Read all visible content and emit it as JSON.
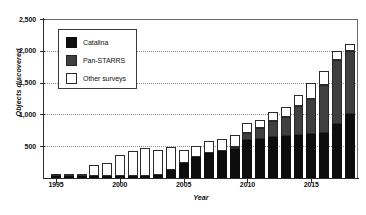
{
  "chart_data": {
    "type": "bar",
    "stacked": true,
    "title": "",
    "xlabel": "Year",
    "ylabel": "Objects discovered",
    "ylim": [
      0,
      2500
    ],
    "ytick_labels": [
      "500",
      "1,000",
      "1,500",
      "2,000",
      "2,500"
    ],
    "ytick_values": [
      500,
      1000,
      1500,
      2000,
      2500
    ],
    "xtick_labels": [
      "1995",
      "2000",
      "2005",
      "2010",
      "2015"
    ],
    "xtick_values": [
      1995,
      2000,
      2005,
      2010,
      2015
    ],
    "grid": "horizontal-dotted",
    "legend_position": "top-left-inset",
    "categories": [
      1995,
      1996,
      1997,
      1998,
      1999,
      2000,
      2001,
      2002,
      2003,
      2004,
      2005,
      2006,
      2007,
      2008,
      2009,
      2010,
      2011,
      2012,
      2013,
      2014,
      2015,
      2016,
      2017,
      2018
    ],
    "series": [
      {
        "name": "Catalina",
        "color": "#0d0d0d",
        "values": [
          5,
          8,
          10,
          12,
          30,
          35,
          25,
          20,
          45,
          120,
          230,
          330,
          390,
          430,
          450,
          600,
          620,
          640,
          660,
          680,
          690,
          700,
          850,
          1000
        ]
      },
      {
        "name": "Pan-STARRS",
        "color": "#3f3f3f",
        "values": [
          0,
          0,
          0,
          0,
          0,
          0,
          0,
          0,
          0,
          0,
          0,
          0,
          0,
          0,
          30,
          110,
          160,
          250,
          300,
          450,
          560,
          760,
          1000,
          1000
        ]
      },
      {
        "name": "Other surveys",
        "color": "#ffffff",
        "values": [
          10,
          12,
          25,
          185,
          200,
          320,
          400,
          450,
          400,
          370,
          210,
          180,
          185,
          185,
          200,
          150,
          140,
          150,
          160,
          170,
          250,
          220,
          150,
          110
        ]
      }
    ],
    "totals": [
      15,
      20,
      35,
      197,
      230,
      355,
      425,
      470,
      445,
      490,
      440,
      510,
      575,
      615,
      680,
      860,
      920,
      1040,
      1120,
      1300,
      1500,
      1680,
      2000,
      2110
    ]
  },
  "legend": {
    "items": [
      {
        "label": "Catalina",
        "swatch": "sw-cat"
      },
      {
        "label": "Pan-STARRS",
        "swatch": "sw-ps"
      },
      {
        "label": "Other surveys",
        "swatch": "sw-oth"
      }
    ]
  }
}
